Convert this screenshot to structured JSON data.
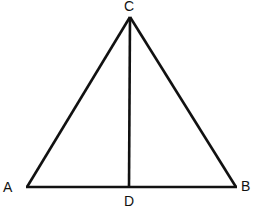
{
  "diagram": {
    "type": "geometry",
    "stroke_color": "#111111",
    "background": "#ffffff",
    "points": {
      "A": {
        "x": 27,
        "y": 187,
        "label": "A"
      },
      "B": {
        "x": 236,
        "y": 187,
        "label": "B"
      },
      "C": {
        "x": 130,
        "y": 17,
        "label": "C"
      },
      "D": {
        "x": 129,
        "y": 187,
        "label": "D"
      }
    },
    "segments": [
      [
        "A",
        "C"
      ],
      [
        "C",
        "B"
      ],
      [
        "A",
        "B"
      ],
      [
        "C",
        "D"
      ]
    ],
    "labels": {
      "A": "A",
      "B": "B",
      "C": "C",
      "D": "D"
    }
  }
}
